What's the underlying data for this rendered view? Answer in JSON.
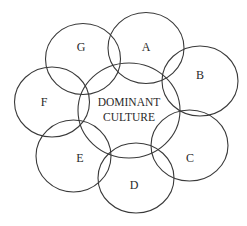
{
  "diagram": {
    "type": "overlapping-circles",
    "center": {
      "label_line1": "DOMINANT",
      "label_line2": "CULTURE"
    },
    "circles": [
      {
        "id": "A",
        "label": "A"
      },
      {
        "id": "B",
        "label": "B"
      },
      {
        "id": "C",
        "label": "C"
      },
      {
        "id": "D",
        "label": "D"
      },
      {
        "id": "E",
        "label": "E"
      },
      {
        "id": "F",
        "label": "F"
      },
      {
        "id": "G",
        "label": "G"
      }
    ],
    "colors": {
      "stroke": "#3a3a3a",
      "background": "#ffffff",
      "text": "#2a2a2a"
    }
  }
}
